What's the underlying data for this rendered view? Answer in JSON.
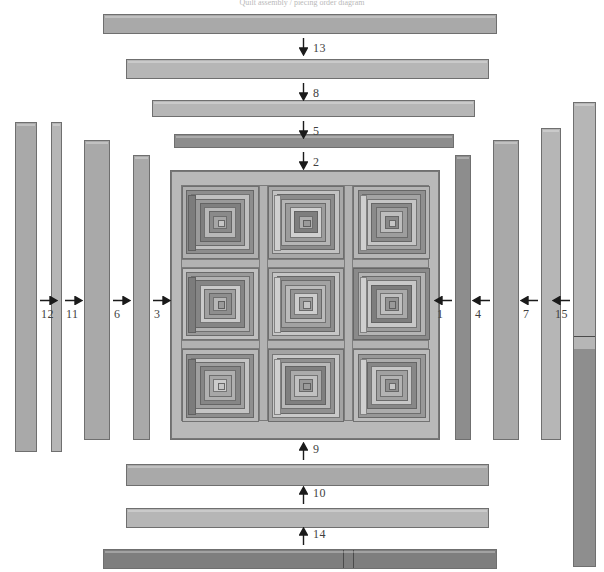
{
  "figure": {
    "caption": "Quilt assembly / piecing order diagram",
    "type": "quilt-construction-diagram",
    "canvas": {
      "width": 604,
      "height": 572
    }
  },
  "palette": {
    "background": "#ffffff",
    "outline": "#6f6f6f",
    "lightest": "#c3c3c3",
    "light": "#b6b6b6",
    "mid": "#a9a9a9",
    "dark": "#8d8d8d",
    "darker": "#7e7e7e",
    "label_text": "#3f3f3f"
  },
  "strips": {
    "top": [
      {
        "number": "13",
        "arrow": "down",
        "tone": "mid",
        "x": 103,
        "y": 14,
        "w": 394,
        "h": 20
      },
      {
        "number": "8",
        "arrow": "down",
        "tone": "light",
        "x": 126,
        "y": 59,
        "w": 363,
        "h": 20
      },
      {
        "number": "5",
        "arrow": "down",
        "tone": "light",
        "x": 152,
        "y": 100,
        "w": 323,
        "h": 17
      },
      {
        "number": "2",
        "arrow": "down",
        "tone": "dark",
        "x": 174,
        "y": 134,
        "w": 280,
        "h": 14
      }
    ],
    "bottom": [
      {
        "number": "9",
        "arrow": "up",
        "tone": "mid",
        "x": 126,
        "y": 464,
        "w": 363,
        "h": 22
      },
      {
        "number": "10",
        "arrow": "up",
        "tone": "light",
        "x": 126,
        "y": 508,
        "w": 363,
        "h": 20
      },
      {
        "number": "14",
        "arrow": "up",
        "tone": "darker",
        "x": 103,
        "y": 549,
        "w": 394,
        "h": 20
      }
    ],
    "left": [
      {
        "number": "12",
        "arrow": "right",
        "tone": "mid",
        "x": 15,
        "y": 122,
        "w": 22,
        "h": 330
      },
      {
        "number": "11",
        "arrow": "right",
        "tone": "light",
        "x": 51,
        "y": 122,
        "w": 11,
        "h": 330
      },
      {
        "number": "6",
        "arrow": "right",
        "tone": "mid",
        "x": 84,
        "y": 140,
        "w": 26,
        "h": 300
      },
      {
        "number": "3",
        "arrow": "right",
        "tone": "mid",
        "x": 133,
        "y": 155,
        "w": 17,
        "h": 285
      }
    ],
    "right": [
      {
        "number": "1",
        "arrow": "left",
        "tone": "dark",
        "x": 455,
        "y": 155,
        "w": 16,
        "h": 285
      },
      {
        "number": "4",
        "arrow": "left",
        "tone": "mid",
        "x": 493,
        "y": 140,
        "w": 26,
        "h": 300
      },
      {
        "number": "7",
        "arrow": "left",
        "tone": "light",
        "x": 541,
        "y": 128,
        "w": 20,
        "h": 312
      },
      {
        "number": "15",
        "arrow": "left",
        "tone": "light",
        "x": 573,
        "y": 102,
        "w": 23,
        "h": 465
      }
    ]
  },
  "seams": {
    "strip14_vertical": [
      342,
      352
    ],
    "strip15_horizontal": [
      335,
      348
    ]
  },
  "quilt": {
    "x": 170,
    "y": 170,
    "w": 270,
    "h": 270,
    "rows": 3,
    "cols": 3,
    "block_type": "log-cabin",
    "blocks": [
      {
        "row": 0,
        "col": 0,
        "rings": [
          "#b0b0b0",
          "#8d8d8d",
          "#c0c0c0",
          "#9a9a9a",
          "#7f7f7f",
          "#b8b8b8",
          "#8a8a8a",
          "#a6a6a6"
        ]
      },
      {
        "row": 0,
        "col": 1,
        "rings": [
          "#a8a8a8",
          "#c2c2c2",
          "#8b8b8b",
          "#b5b5b5",
          "#9c9c9c",
          "#d0d0d0",
          "#7e7e7e",
          "#aeaeae"
        ]
      },
      {
        "row": 0,
        "col": 2,
        "rings": [
          "#b6b6b6",
          "#8f8f8f",
          "#a4a4a4",
          "#c5c5c5",
          "#8a8a8a",
          "#9e9e9e",
          "#bdbdbd",
          "#888888"
        ]
      },
      {
        "row": 1,
        "col": 0,
        "rings": [
          "#c0c0c0",
          "#9a9a9a",
          "#b2b2b2",
          "#858585",
          "#cacaca",
          "#a0a0a0",
          "#8e8e8e",
          "#b7b7b7"
        ]
      },
      {
        "row": 1,
        "col": 1,
        "rings": [
          "#aeaeae",
          "#c6c6c6",
          "#8c8c8c",
          "#a2a2a2",
          "#bbbbbb",
          "#949494",
          "#cdcdcd",
          "#9f9f9f"
        ]
      },
      {
        "row": 1,
        "col": 2,
        "rings": [
          "#8a8a8a",
          "#b4b4b4",
          "#9d9d9d",
          "#c8c8c8",
          "#7d7d7d",
          "#aaaaaa",
          "#bfbfbf",
          "#939393"
        ]
      },
      {
        "row": 2,
        "col": 0,
        "rings": [
          "#b8b8b8",
          "#8e8e8e",
          "#c4c4c4",
          "#9f9f9f",
          "#868686",
          "#b0b0b0",
          "#a7a7a7",
          "#cccccc"
        ]
      },
      {
        "row": 2,
        "col": 1,
        "rings": [
          "#a3a3a3",
          "#c9c9c9",
          "#909090",
          "#b9b9b9",
          "#7f7f7f",
          "#ababab",
          "#c1c1c1",
          "#999999"
        ]
      },
      {
        "row": 2,
        "col": 2,
        "rings": [
          "#bcbcbc",
          "#989898",
          "#adadad",
          "#878787",
          "#c7c7c7",
          "#a1a1a1",
          "#b3b3b3",
          "#8f8f8f"
        ]
      }
    ]
  }
}
